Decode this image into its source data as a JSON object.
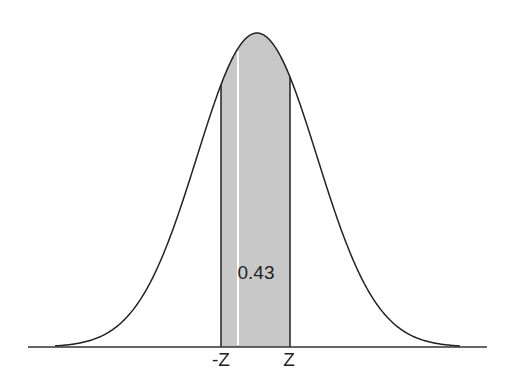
{
  "diagram": {
    "type": "normal-distribution",
    "shaded_area_label": "0.43",
    "left_bound_label": "-Z",
    "right_bound_label": "Z",
    "colors": {
      "curve": "#222222",
      "shade": "#c8c8c8",
      "axis": "#333333",
      "highlight_line": "#ffffff"
    }
  },
  "chart_data": {
    "type": "area",
    "title": "",
    "xlabel": "",
    "ylabel": "",
    "distribution": "standard normal",
    "shaded_region": {
      "from": "-Z",
      "to": "Z",
      "area": 0.43
    },
    "tick_labels": [
      "-Z",
      "Z"
    ]
  }
}
